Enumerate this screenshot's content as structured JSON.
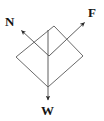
{
  "figure": {
    "kind": "free-body-diagram",
    "title": "",
    "background_color": "#ffffff",
    "line_color": "#5a5a5a",
    "arrow_color": "#2b2b2b",
    "label_color": "#141414",
    "body": {
      "name": "tilted-square-block",
      "shape": "square",
      "rotation_deg": 45,
      "vertices": [
        {
          "name": "top",
          "x": 54,
          "y": 26
        },
        {
          "name": "right",
          "x": 83,
          "y": 56
        },
        {
          "name": "bottom",
          "x": 48,
          "y": 87
        },
        {
          "name": "left",
          "x": 16,
          "y": 57
        }
      ],
      "center": {
        "x": 49,
        "y": 56
      }
    },
    "vectors": [
      {
        "id": "normal",
        "label": "N",
        "meaning": "normal-force",
        "direction": "up-left",
        "tail": {
          "x": 49,
          "y": 56
        },
        "tip": {
          "x": 20,
          "y": 29
        },
        "label_position": {
          "x": 5,
          "y": 15
        }
      },
      {
        "id": "applied",
        "label": "F",
        "meaning": "applied-force",
        "direction": "up-right",
        "tail": {
          "x": 49,
          "y": 56
        },
        "tip": {
          "x": 86,
          "y": 21
        },
        "label_position": {
          "x": 88,
          "y": 6
        }
      },
      {
        "id": "weight",
        "label": "W",
        "meaning": "weight-force",
        "direction": "down",
        "tail": {
          "x": 48,
          "y": 30
        },
        "tip": {
          "x": 48,
          "y": 101
        },
        "label_position": {
          "x": 41,
          "y": 104
        }
      }
    ]
  }
}
